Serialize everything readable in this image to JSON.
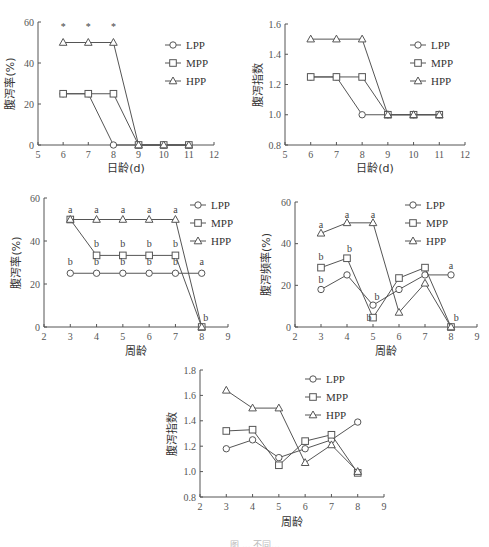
{
  "chart_data": [
    {
      "id": "panel-1",
      "type": "line",
      "title": "",
      "xlabel": "日龄(d)",
      "ylabel": "腹泻率(%)",
      "x": [
        6,
        7,
        8,
        9,
        10,
        11
      ],
      "xlim": [
        5,
        12
      ],
      "xticks": [
        5,
        6,
        7,
        8,
        9,
        10,
        11,
        12
      ],
      "ylim": [
        0,
        60
      ],
      "yticks": [
        0,
        20,
        40,
        60
      ],
      "grid": false,
      "legend_position": "upper right",
      "series": [
        {
          "name": "LPP",
          "marker": "circle",
          "values": [
            25,
            25,
            0,
            0,
            0,
            0
          ]
        },
        {
          "name": "MPP",
          "marker": "square",
          "values": [
            25,
            25,
            25,
            0,
            0,
            0
          ]
        },
        {
          "name": "HPP",
          "marker": "triangle",
          "values": [
            50,
            50,
            50,
            0,
            0,
            0
          ]
        }
      ],
      "annotations": [
        {
          "x": 6,
          "text": "*"
        },
        {
          "x": 7,
          "text": "*"
        },
        {
          "x": 8,
          "text": "*"
        }
      ]
    },
    {
      "id": "panel-2",
      "type": "line",
      "title": "",
      "xlabel": "日龄(d)",
      "ylabel": "腹泻指数",
      "x": [
        6,
        7,
        8,
        9,
        10,
        11
      ],
      "xlim": [
        5,
        12
      ],
      "xticks": [
        5,
        6,
        7,
        8,
        9,
        10,
        11,
        12
      ],
      "ylim": [
        0.8,
        1.6
      ],
      "yticks": [
        0.8,
        1.0,
        1.2,
        1.4,
        1.6
      ],
      "grid": false,
      "legend_position": "upper right",
      "series": [
        {
          "name": "LPP",
          "marker": "circle",
          "values": [
            1.25,
            1.25,
            1.0,
            1.0,
            1.0,
            1.0
          ]
        },
        {
          "name": "MPP",
          "marker": "square",
          "values": [
            1.25,
            1.25,
            1.25,
            1.0,
            1.0,
            1.0
          ]
        },
        {
          "name": "HPP",
          "marker": "triangle",
          "values": [
            1.5,
            1.5,
            1.5,
            1.0,
            1.0,
            1.0
          ]
        }
      ]
    },
    {
      "id": "panel-3",
      "type": "line",
      "title": "",
      "xlabel": "周龄",
      "ylabel": "腹泻率(%)",
      "x": [
        3,
        4,
        5,
        6,
        7,
        8
      ],
      "xlim": [
        2,
        9
      ],
      "xticks": [
        2,
        3,
        4,
        5,
        6,
        7,
        8,
        9
      ],
      "ylim": [
        0,
        60
      ],
      "yticks": [
        0,
        20,
        40,
        60
      ],
      "grid": false,
      "legend_position": "upper right",
      "series": [
        {
          "name": "LPP",
          "marker": "circle",
          "values": [
            25,
            25,
            25,
            25,
            25,
            25
          ]
        },
        {
          "name": "MPP",
          "marker": "square",
          "values": [
            50,
            33.3,
            33.3,
            33.3,
            33.3,
            0
          ]
        },
        {
          "name": "HPP",
          "marker": "triangle",
          "values": [
            50,
            50,
            50,
            50,
            50,
            0
          ]
        }
      ],
      "annotations": [
        {
          "x": 3,
          "y": 53,
          "text": "a"
        },
        {
          "x": 4,
          "y": 53,
          "text": "a"
        },
        {
          "x": 5,
          "y": 53,
          "text": "a"
        },
        {
          "x": 6,
          "y": 53,
          "text": "a"
        },
        {
          "x": 7,
          "y": 53,
          "text": "a"
        },
        {
          "x": 4,
          "y": 37,
          "text": "b"
        },
        {
          "x": 5,
          "y": 37,
          "text": "b"
        },
        {
          "x": 6,
          "y": 37,
          "text": "b"
        },
        {
          "x": 7,
          "y": 37,
          "text": "b"
        },
        {
          "x": 3,
          "y": 29,
          "text": "b"
        },
        {
          "x": 4,
          "y": 29,
          "text": "b"
        },
        {
          "x": 5,
          "y": 29,
          "text": "b"
        },
        {
          "x": 6,
          "y": 29,
          "text": "b"
        },
        {
          "x": 7,
          "y": 29,
          "text": "b"
        },
        {
          "x": 8,
          "y": 29,
          "text": "a"
        },
        {
          "x": 8.15,
          "y": 3,
          "text": "b"
        }
      ]
    },
    {
      "id": "panel-4",
      "type": "line",
      "title": "",
      "xlabel": "周龄",
      "ylabel": "腹泻频率(%)",
      "x": [
        3,
        4,
        5,
        6,
        7,
        8
      ],
      "xlim": [
        2,
        9
      ],
      "xticks": [
        2,
        3,
        4,
        5,
        6,
        7,
        8,
        9
      ],
      "ylim": [
        0,
        60
      ],
      "yticks": [
        0,
        20,
        40,
        60
      ],
      "grid": false,
      "legend_position": "upper right",
      "series": [
        {
          "name": "LPP",
          "marker": "circle",
          "values": [
            18,
            25,
            10.5,
            18,
            25,
            25
          ]
        },
        {
          "name": "MPP",
          "marker": "square",
          "values": [
            28.5,
            33,
            4.5,
            23.5,
            28.5,
            0
          ]
        },
        {
          "name": "HPP",
          "marker": "triangle",
          "values": [
            45,
            50,
            50,
            7,
            21,
            0
          ]
        }
      ],
      "annotations": [
        {
          "x": 3,
          "y": 47.5,
          "text": "a"
        },
        {
          "x": 4,
          "y": 52.5,
          "text": "a"
        },
        {
          "x": 5,
          "y": 52.5,
          "text": "a"
        },
        {
          "x": 3,
          "y": 32,
          "text": "b"
        },
        {
          "x": 4.1,
          "y": 36,
          "text": "b"
        },
        {
          "x": 3,
          "y": 21,
          "text": "b"
        },
        {
          "x": 5.15,
          "y": 13,
          "text": "b"
        },
        {
          "x": 4.85,
          "y": 3,
          "text": "b"
        },
        {
          "x": 8,
          "y": 28,
          "text": "a"
        },
        {
          "x": 8.2,
          "y": 3,
          "text": "b"
        }
      ]
    },
    {
      "id": "panel-5",
      "type": "line",
      "title": "",
      "xlabel": "周龄",
      "ylabel": "腹泻指数",
      "x": [
        3,
        4,
        5,
        6,
        7,
        8
      ],
      "xlim": [
        2,
        9
      ],
      "xticks": [
        2,
        3,
        4,
        5,
        6,
        7,
        8,
        9
      ],
      "ylim": [
        0.8,
        1.8
      ],
      "yticks": [
        0.8,
        1.0,
        1.2,
        1.4,
        1.6,
        1.8
      ],
      "grid": false,
      "legend_position": "upper right",
      "series": [
        {
          "name": "LPP",
          "marker": "circle",
          "values": [
            1.18,
            1.25,
            1.11,
            1.18,
            1.25,
            1.39
          ]
        },
        {
          "name": "MPP",
          "marker": "square",
          "values": [
            1.32,
            1.33,
            1.05,
            1.24,
            1.29,
            0.99
          ]
        },
        {
          "name": "HPP",
          "marker": "triangle",
          "values": [
            1.64,
            1.5,
            1.5,
            1.07,
            1.21,
            1.0
          ]
        }
      ]
    }
  ],
  "legend_labels": [
    "LPP",
    "MPP",
    "HPP"
  ],
  "caption": "图 ... 不同..."
}
